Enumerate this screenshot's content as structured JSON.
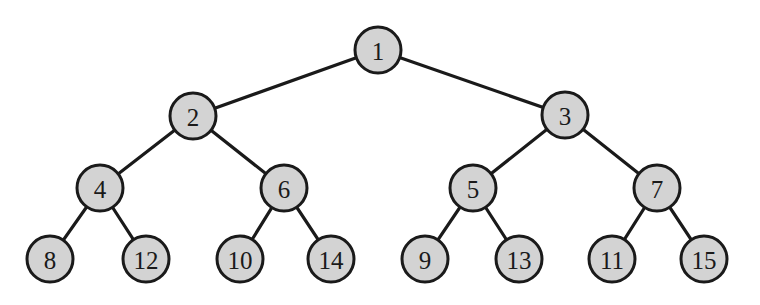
{
  "diagram": {
    "type": "binary-tree",
    "colors": {
      "node_fill": "#d3d3d3",
      "stroke": "#1a1a1a",
      "background": "#ffffff"
    },
    "node_radius": 23,
    "nodes": [
      {
        "id": "n1",
        "label": "1",
        "x": 378,
        "y": 50
      },
      {
        "id": "n2",
        "label": "2",
        "x": 193,
        "y": 116
      },
      {
        "id": "n3",
        "label": "3",
        "x": 565,
        "y": 115
      },
      {
        "id": "n4",
        "label": "4",
        "x": 100,
        "y": 188
      },
      {
        "id": "n6",
        "label": "6",
        "x": 284,
        "y": 188
      },
      {
        "id": "n5",
        "label": "5",
        "x": 473,
        "y": 188
      },
      {
        "id": "n7",
        "label": "7",
        "x": 657,
        "y": 188
      },
      {
        "id": "n8",
        "label": "8",
        "x": 50,
        "y": 259
      },
      {
        "id": "n12",
        "label": "12",
        "x": 146,
        "y": 259
      },
      {
        "id": "n10",
        "label": "10",
        "x": 240,
        "y": 259
      },
      {
        "id": "n14",
        "label": "14",
        "x": 331,
        "y": 259
      },
      {
        "id": "n9",
        "label": "9",
        "x": 425,
        "y": 259
      },
      {
        "id": "n13",
        "label": "13",
        "x": 519,
        "y": 259
      },
      {
        "id": "n11",
        "label": "11",
        "x": 612,
        "y": 259
      },
      {
        "id": "n15",
        "label": "15",
        "x": 704,
        "y": 259
      }
    ],
    "edges": [
      [
        "n1",
        "n2"
      ],
      [
        "n1",
        "n3"
      ],
      [
        "n2",
        "n4"
      ],
      [
        "n2",
        "n6"
      ],
      [
        "n3",
        "n5"
      ],
      [
        "n3",
        "n7"
      ],
      [
        "n4",
        "n8"
      ],
      [
        "n4",
        "n12"
      ],
      [
        "n6",
        "n10"
      ],
      [
        "n6",
        "n14"
      ],
      [
        "n5",
        "n9"
      ],
      [
        "n5",
        "n13"
      ],
      [
        "n7",
        "n11"
      ],
      [
        "n7",
        "n15"
      ]
    ]
  }
}
